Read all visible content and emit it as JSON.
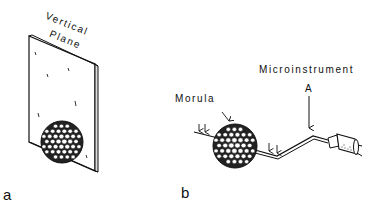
{
  "figure": {
    "panels": [
      {
        "id": "a",
        "letter": "a",
        "labels": {
          "plane_line1": "Vertical",
          "plane_line2": "Plane"
        }
      },
      {
        "id": "b",
        "letter": "b",
        "labels": {
          "morula": "Morula",
          "instrument": "Microinstrument",
          "instrument_marker": "A"
        }
      }
    ]
  }
}
